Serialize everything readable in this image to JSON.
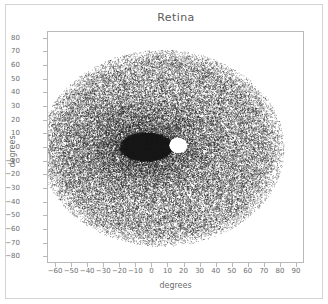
{
  "figure": {
    "title": "Retina",
    "xlabel": "degrees",
    "ylabel": "degrees"
  },
  "chart_data": {
    "type": "scatter",
    "title": "Retina",
    "xlabel": "degrees",
    "ylabel": "degrees",
    "xlim": [
      -65,
      95
    ],
    "ylim": [
      -85,
      85
    ],
    "xticks": [
      -60,
      -50,
      -40,
      -30,
      -20,
      -10,
      0,
      10,
      20,
      30,
      40,
      50,
      60,
      70,
      80,
      90
    ],
    "yticks": [
      80,
      70,
      60,
      50,
      40,
      30,
      20,
      10,
      0,
      -10,
      -20,
      -30,
      -40,
      -50,
      -60,
      -70,
      -80
    ],
    "grid": false,
    "legend": null,
    "marker": {
      "shape": "point",
      "size": 0.6,
      "color": "#1a1a1a"
    },
    "point_count": 42000,
    "distribution": {
      "cloud_center": [
        6,
        0
      ],
      "cloud_radius_x": 76,
      "cloud_radius_y": 72,
      "density_falloff": "gaussian-radial",
      "core_peak_density": 1.0,
      "edge_density": 0.06
    },
    "features": [
      {
        "name": "fovea",
        "center": [
          -4,
          1
        ],
        "radius_x": 17,
        "radius_y": 11,
        "density": "saturated",
        "color": "#111111"
      },
      {
        "name": "optic-disc",
        "center": [
          16,
          2
        ],
        "radius_x": 5.5,
        "radius_y": 5.5,
        "density": "void",
        "color": "#ffffff"
      }
    ]
  }
}
